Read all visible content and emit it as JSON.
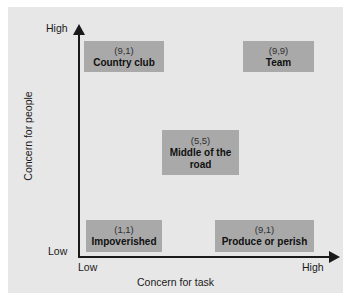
{
  "chart_data": {
    "type": "scatter",
    "title": "",
    "xlabel": "Concern for task",
    "ylabel": "Concern for people",
    "x_ticks": [
      "Low",
      "High"
    ],
    "y_ticks": [
      "Low",
      "High"
    ],
    "grid": false,
    "legend": "none",
    "points": [
      {
        "coords": "(9,1)",
        "label": "Country club",
        "x": 1,
        "y": 9
      },
      {
        "coords": "(9,9)",
        "label": "Team",
        "x": 9,
        "y": 9
      },
      {
        "coords": "(5,5)",
        "label": "Middle of the road",
        "x": 5,
        "y": 5
      },
      {
        "coords": "(1,1)",
        "label": "Impoverished",
        "x": 1,
        "y": 1
      },
      {
        "coords": "(9,1)",
        "label": "Produce or perish",
        "x": 9,
        "y": 1
      }
    ]
  },
  "axes": {
    "x_title": "Concern for task",
    "y_title": "Concern for people",
    "x_low": "Low",
    "x_high": "High",
    "y_low": "Low",
    "y_high": "High"
  },
  "cells": {
    "country_club": {
      "coords": "(9,1)",
      "label": "Country club"
    },
    "team": {
      "coords": "(9,9)",
      "label": "Team"
    },
    "middle_road": {
      "coords": "(5,5)",
      "label": "Middle of the road"
    },
    "impoverished": {
      "coords": "(1,1)",
      "label": "Impoverished"
    },
    "produce_perish": {
      "coords": "(9,1)",
      "label": "Produce or perish"
    }
  },
  "colors": {
    "panel_background": "#e7e7e7",
    "cell_fill": "#a9a9a9",
    "axis": "#1a1a1a",
    "text": "#101010"
  }
}
